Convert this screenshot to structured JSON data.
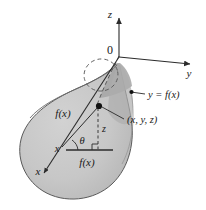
{
  "figure": {
    "colors": {
      "body_fill": "#c6c6c6",
      "body_shade_dark": "#a8a8a8",
      "body_shade_light": "#d6d6d6",
      "outline": "#4a4a4a",
      "axis": "#2b2b2b",
      "text": "#1a1a1a",
      "background": "#ffffff"
    },
    "axes": [
      {
        "name": "z-axis",
        "label": "z",
        "direction": "up"
      },
      {
        "name": "y-axis",
        "label": "y",
        "direction": "right"
      },
      {
        "name": "x-axis",
        "label": "x",
        "direction": "lower-left"
      }
    ],
    "origin_label": "0",
    "annotations": [
      {
        "name": "curve-label",
        "text": "y = f(x)"
      },
      {
        "name": "point-label",
        "text": "(x, y, z)"
      },
      {
        "name": "radius-label",
        "text": "f(x)"
      },
      {
        "name": "base-label",
        "text": "f(x)"
      },
      {
        "name": "height-label",
        "text": "z"
      },
      {
        "name": "angle-label",
        "text": "θ"
      },
      {
        "name": "x-distance-label",
        "text": "x"
      }
    ],
    "labels": {
      "z_axis": "z",
      "y_axis": "y",
      "x_axis": "x",
      "origin": "0",
      "curve": "y = f(x)",
      "point": "(x, y, z)",
      "radius_upper": "f(x)",
      "radius_base": "f(x)",
      "height": "z",
      "angle": "θ",
      "x_distance": "x"
    }
  }
}
